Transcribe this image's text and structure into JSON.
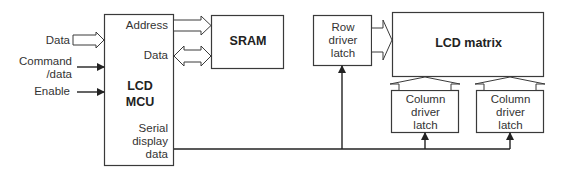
{
  "diagram": {
    "inputs": {
      "data": "Data",
      "command_line1": "Command",
      "command_line2": "/data",
      "enable": "Enable"
    },
    "mcu": {
      "title_line1": "LCD",
      "title_line2": "MCU",
      "address_port": "Address",
      "data_port": "Data",
      "serial_line1": "Serial",
      "serial_line2": "display",
      "serial_line3": "data"
    },
    "sram": {
      "label": "SRAM"
    },
    "row_driver": {
      "line1": "Row",
      "line2": "driver",
      "line3": "latch"
    },
    "lcd_matrix": {
      "label": "LCD matrix"
    },
    "column_driver_1": {
      "line1": "Column",
      "line2": "driver",
      "line3": "latch"
    },
    "column_driver_2": {
      "line1": "Column",
      "line2": "driver",
      "line3": "latch"
    },
    "colors": {
      "stroke": "#3a3a3a",
      "background": "#ffffff"
    }
  }
}
